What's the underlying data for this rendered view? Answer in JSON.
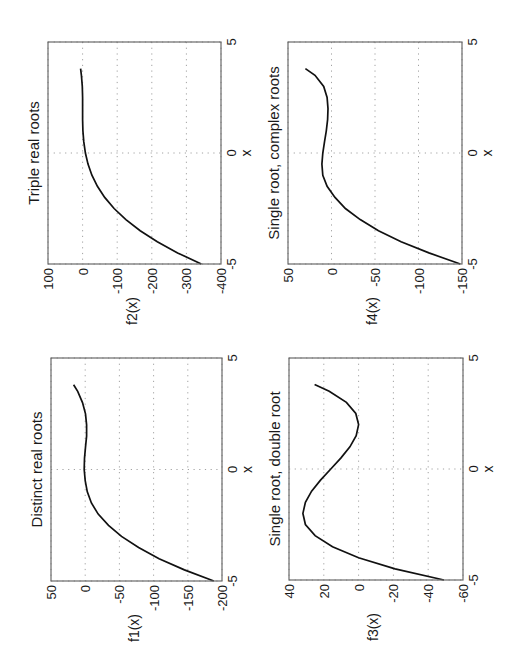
{
  "figure": {
    "rotation_deg": -90,
    "background": "#ffffff",
    "line_color": "#111111"
  },
  "chart_data": [
    {
      "id": "f1",
      "type": "line",
      "title": "Distinct real roots",
      "xlabel": "x",
      "ylabel": "f1(x)",
      "xlim": [
        -5,
        5
      ],
      "ylim": [
        -200,
        50
      ],
      "xticks": [
        "-5",
        "0",
        "5"
      ],
      "yticks": [
        "-200",
        "-150",
        "-100",
        "-50",
        "0",
        "50"
      ],
      "grid": true,
      "box": {
        "left": 51,
        "top": 358,
        "right": 222,
        "bottom": 581
      },
      "x": [
        -5,
        -4.5,
        -4,
        -3.5,
        -3,
        -2.5,
        -2,
        -1.5,
        -1,
        -0.5,
        0,
        0.5,
        1,
        1.5,
        2,
        2.5,
        3,
        3.5,
        3.8
      ],
      "values": [
        -188,
        -145,
        -108,
        -78,
        -53,
        -34,
        -19,
        -9,
        -3,
        0,
        1.5,
        1,
        -0.5,
        -2,
        -2,
        -0.5,
        4,
        11,
        17
      ]
    },
    {
      "id": "f2",
      "type": "line",
      "title": "Triple real roots",
      "xlabel": "x",
      "ylabel": "f2(x)",
      "xlim": [
        -5,
        5
      ],
      "ylim": [
        -400,
        100
      ],
      "xticks": [
        "-5",
        "0",
        "5"
      ],
      "yticks": [
        "-400",
        "-300",
        "-200",
        "-100",
        "0",
        "100"
      ],
      "grid": true,
      "box": {
        "left": 48,
        "top": 42,
        "right": 221,
        "bottom": 264
      },
      "x": [
        -5,
        -4.5,
        -4,
        -3.5,
        -3,
        -2.5,
        -2,
        -1.5,
        -1,
        -0.5,
        0,
        0.5,
        1,
        1.5,
        2,
        2.5,
        3,
        3.5,
        3.8
      ],
      "values": [
        -343,
        -274.6,
        -216,
        -166.4,
        -125,
        -91.1,
        -64,
        -42.9,
        -27,
        -15.6,
        -8,
        -3.4,
        -1,
        -0.1,
        0,
        0.1,
        1,
        3.4,
        5.8
      ]
    },
    {
      "id": "f3",
      "type": "line",
      "title": "Single root, double root",
      "xlabel": "x",
      "ylabel": "f3(x)",
      "xlim": [
        -5,
        5
      ],
      "ylim": [
        -60,
        40
      ],
      "xticks": [
        "-5",
        "0",
        "5"
      ],
      "yticks": [
        "-60",
        "-40",
        "-20",
        "0",
        "20",
        "40"
      ],
      "grid": true,
      "box": {
        "left": 289,
        "top": 358,
        "right": 463,
        "bottom": 580
      },
      "x": [
        -5,
        -4.5,
        -4,
        -3.5,
        -3,
        -2.5,
        -2,
        -1.5,
        -1,
        -0.5,
        0,
        0.5,
        1,
        1.5,
        2,
        2.5,
        3,
        3.5,
        3.8
      ],
      "values": [
        -49,
        -21,
        0,
        15,
        25,
        30.6,
        32,
        30.6,
        27,
        21.9,
        16,
        10.1,
        5,
        1.4,
        0,
        1.6,
        7,
        16.9,
        25.3
      ]
    },
    {
      "id": "f4",
      "type": "line",
      "title": "Single root, complex roots",
      "xlabel": "x",
      "ylabel": "f4(x)",
      "xlim": [
        -5,
        5
      ],
      "ylim": [
        -150,
        50
      ],
      "xticks": [
        "-5",
        "0",
        "5"
      ],
      "yticks": [
        "-150",
        "-100",
        "-50",
        "0",
        "50"
      ],
      "grid": true,
      "box": {
        "left": 288,
        "top": 42,
        "right": 462,
        "bottom": 264
      },
      "x": [
        -5,
        -4.5,
        -4,
        -3.5,
        -3,
        -2.5,
        -2,
        -1.5,
        -1,
        -0.5,
        0,
        0.5,
        1,
        1.5,
        2,
        2.5,
        3,
        3.5,
        3.8
      ],
      "values": [
        -148,
        -112,
        -80,
        -54,
        -33,
        -16,
        -4,
        5,
        10,
        11,
        10,
        8,
        6,
        4.5,
        4,
        5,
        9,
        19,
        30
      ]
    }
  ]
}
